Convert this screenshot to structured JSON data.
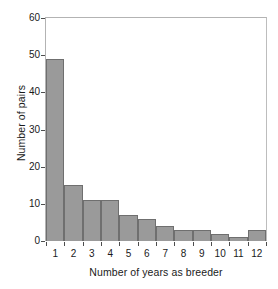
{
  "chart_data": {
    "type": "bar",
    "title": "",
    "subtitle": "",
    "xlabel": "Number of years as breeder",
    "ylabel": "Number of pairs",
    "categories": [
      "1",
      "2",
      "3",
      "4",
      "5",
      "6",
      "7",
      "8",
      "9",
      "10",
      "11",
      "12"
    ],
    "values": [
      49,
      15,
      11,
      11,
      7,
      6,
      4,
      3,
      3,
      2,
      1,
      3
    ],
    "series": [
      {
        "name": "Number of pairs",
        "values": [
          49,
          15,
          11,
          11,
          7,
          6,
          4,
          3,
          3,
          2,
          1,
          3
        ]
      }
    ],
    "ylim": [
      0,
      60
    ],
    "yticks": [
      0,
      10,
      20,
      30,
      40,
      50,
      60
    ],
    "ytick_labels": [
      "0",
      "10",
      "20",
      "30",
      "40",
      "50",
      "60"
    ],
    "xtick_labels": [
      "1",
      "2",
      "3",
      "4",
      "5",
      "6",
      "7",
      "8",
      "9",
      "10",
      "11",
      "12"
    ],
    "grid": false,
    "legend": false,
    "legend_position": "none",
    "bar_color": "#9a9a9a",
    "bar_edge_color": "#6f6f6f",
    "frame_color": "#b3b3b3",
    "text_color": "#1a1a1a",
    "background": "#ffffff"
  }
}
